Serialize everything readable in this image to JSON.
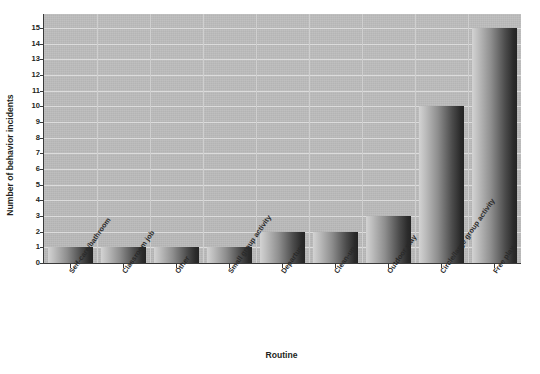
{
  "chart_data": {
    "type": "bar",
    "title": "",
    "xlabel": "Routine",
    "ylabel": "Number of behavior incidents",
    "categories": [
      "Self-care/bathroom",
      "Classroom job",
      "Other",
      "Small group activity",
      "Departure",
      "Clean-up",
      "Outdoor play",
      "Circle/large group activity",
      "Free play"
    ],
    "values": [
      1,
      1,
      1,
      1,
      2,
      2,
      3,
      10,
      15
    ],
    "ylim": [
      0,
      15.9
    ],
    "yticks": [
      0,
      1,
      2,
      3,
      4,
      5,
      6,
      7,
      8,
      9,
      10,
      11,
      12,
      13,
      14,
      15
    ],
    "ytick_labels": [
      "0",
      "1",
      "2",
      "3",
      "4",
      "5",
      "6",
      "7",
      "8",
      "9",
      "10",
      "11",
      "12",
      "13",
      "14",
      "15"
    ],
    "grid": "horizontal-and-vertical",
    "legend": "none",
    "bar_fill": "#8e8e8e",
    "bar_gradient": [
      "#d3d3d3",
      "#242424"
    ],
    "plot_background": "#b9b9b9",
    "axis_color": "#3a3a3a",
    "gridline_color": "#dcdcdc",
    "text_color": "#231f20"
  },
  "axes": {
    "y_title": "Number of behavior incidents",
    "x_title": "Routine"
  }
}
